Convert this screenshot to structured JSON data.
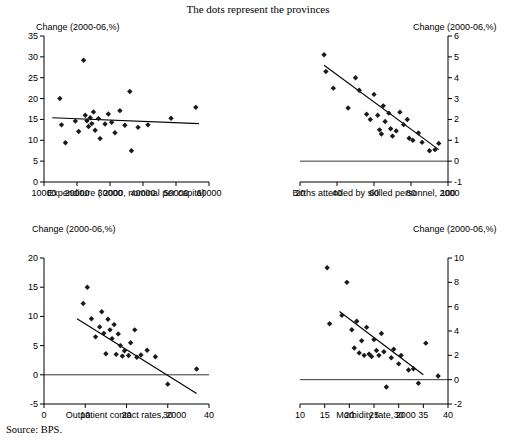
{
  "figure": {
    "title": "The dots represent the provinces",
    "source": "Source:  BPS."
  },
  "chart_data": [
    {
      "type": "scatter",
      "panel": "top-left",
      "title": "",
      "ylabel": "Change (2000-06,%)",
      "xlabel": "Expenditure ( 2000, nominal per capita)",
      "xlim": [
        10000,
        60000
      ],
      "ylim": [
        0,
        35
      ],
      "xticks": [
        10000,
        20000,
        30000,
        40000,
        50000,
        60000
      ],
      "yticks": [
        0,
        5,
        10,
        15,
        20,
        25,
        30,
        35
      ],
      "grid": false,
      "legend": "none",
      "trendline": {
        "x0": 12500,
        "y0": 15.4,
        "x1": 57000,
        "y1": 14.0
      },
      "points": [
        {
          "x": 14800,
          "y": 20.0
        },
        {
          "x": 15300,
          "y": 13.7
        },
        {
          "x": 16500,
          "y": 9.4
        },
        {
          "x": 19500,
          "y": 14.6
        },
        {
          "x": 20500,
          "y": 12.1
        },
        {
          "x": 22000,
          "y": 29.2
        },
        {
          "x": 22500,
          "y": 16.0
        },
        {
          "x": 23000,
          "y": 14.7
        },
        {
          "x": 23500,
          "y": 13.3
        },
        {
          "x": 24000,
          "y": 15.4
        },
        {
          "x": 24500,
          "y": 14.0
        },
        {
          "x": 25000,
          "y": 16.8
        },
        {
          "x": 25500,
          "y": 12.4
        },
        {
          "x": 26500,
          "y": 15.2
        },
        {
          "x": 27000,
          "y": 10.4
        },
        {
          "x": 28500,
          "y": 13.9
        },
        {
          "x": 29500,
          "y": 16.3
        },
        {
          "x": 30500,
          "y": 14.3
        },
        {
          "x": 31500,
          "y": 11.8
        },
        {
          "x": 33000,
          "y": 17.1
        },
        {
          "x": 34500,
          "y": 13.6
        },
        {
          "x": 36000,
          "y": 21.7
        },
        {
          "x": 36500,
          "y": 7.5
        },
        {
          "x": 38500,
          "y": 13.1
        },
        {
          "x": 41500,
          "y": 13.7
        },
        {
          "x": 48500,
          "y": 15.3
        },
        {
          "x": 56000,
          "y": 17.9
        }
      ]
    },
    {
      "type": "scatter",
      "panel": "top-right",
      "title": "",
      "ylabel": "Change (2000-06,%)",
      "xlabel": "Births attended by skilled personnel, 2000",
      "xlim": [
        20,
        100
      ],
      "ylim": [
        -1,
        6
      ],
      "xticks": [
        20,
        40,
        60,
        80,
        100
      ],
      "yticks": [
        -1,
        0,
        1,
        2,
        3,
        4,
        5,
        6
      ],
      "grid": false,
      "legend": "none",
      "zeroline": true,
      "trendline": {
        "x0": 33,
        "y0": 4.6,
        "x1": 95,
        "y1": 0.55
      },
      "points": [
        {
          "x": 33,
          "y": 5.1
        },
        {
          "x": 34,
          "y": 4.3
        },
        {
          "x": 38,
          "y": 3.5
        },
        {
          "x": 46,
          "y": 2.55
        },
        {
          "x": 50,
          "y": 4.0
        },
        {
          "x": 52,
          "y": 3.4
        },
        {
          "x": 56,
          "y": 2.25
        },
        {
          "x": 58,
          "y": 2.0
        },
        {
          "x": 60,
          "y": 3.2
        },
        {
          "x": 62,
          "y": 2.2
        },
        {
          "x": 63,
          "y": 1.5
        },
        {
          "x": 64,
          "y": 1.3
        },
        {
          "x": 65,
          "y": 2.65
        },
        {
          "x": 66,
          "y": 1.9
        },
        {
          "x": 68,
          "y": 2.3
        },
        {
          "x": 69,
          "y": 1.55
        },
        {
          "x": 70,
          "y": 1.2
        },
        {
          "x": 72,
          "y": 1.45
        },
        {
          "x": 74,
          "y": 2.35
        },
        {
          "x": 76,
          "y": 1.75
        },
        {
          "x": 78,
          "y": 2.0
        },
        {
          "x": 79,
          "y": 1.1
        },
        {
          "x": 81,
          "y": 1.0
        },
        {
          "x": 84,
          "y": 1.35
        },
        {
          "x": 86,
          "y": 0.9
        },
        {
          "x": 90,
          "y": 0.5
        },
        {
          "x": 93,
          "y": 0.55
        },
        {
          "x": 95,
          "y": 0.85
        }
      ]
    },
    {
      "type": "scatter",
      "panel": "bottom-left",
      "title": "",
      "ylabel": "Change (2000-06,%)",
      "xlabel": "Outpatient contact rates, 2000",
      "xlim": [
        0,
        40
      ],
      "ylim": [
        -5,
        20
      ],
      "xticks": [
        0,
        10,
        20,
        30,
        40
      ],
      "yticks": [
        -5,
        0,
        5,
        10,
        15,
        20
      ],
      "grid": false,
      "legend": "none",
      "zeroline": true,
      "trendline": {
        "x0": 8,
        "y0": 9.6,
        "x1": 37,
        "y1": -3.2
      },
      "points": [
        {
          "x": 9.5,
          "y": 12.2
        },
        {
          "x": 10.5,
          "y": 15.0
        },
        {
          "x": 11.5,
          "y": 9.6
        },
        {
          "x": 12.5,
          "y": 6.5
        },
        {
          "x": 13.5,
          "y": 8.2
        },
        {
          "x": 14.0,
          "y": 10.8
        },
        {
          "x": 14.5,
          "y": 7.1
        },
        {
          "x": 15.0,
          "y": 3.6
        },
        {
          "x": 15.5,
          "y": 9.5
        },
        {
          "x": 16.0,
          "y": 7.7
        },
        {
          "x": 16.5,
          "y": 6.2
        },
        {
          "x": 17.0,
          "y": 8.6
        },
        {
          "x": 17.5,
          "y": 3.5
        },
        {
          "x": 18.0,
          "y": 7.0
        },
        {
          "x": 18.5,
          "y": 5.0
        },
        {
          "x": 19.0,
          "y": 3.2
        },
        {
          "x": 19.5,
          "y": 4.1
        },
        {
          "x": 20.5,
          "y": 3.3
        },
        {
          "x": 21.0,
          "y": 5.5
        },
        {
          "x": 22.0,
          "y": 7.7
        },
        {
          "x": 22.5,
          "y": 3.0
        },
        {
          "x": 23.5,
          "y": 3.4
        },
        {
          "x": 25.0,
          "y": 4.2
        },
        {
          "x": 27.0,
          "y": 3.1
        },
        {
          "x": 30.0,
          "y": -1.6
        },
        {
          "x": 37.0,
          "y": 1.0
        }
      ]
    },
    {
      "type": "scatter",
      "panel": "bottom-right",
      "title": "",
      "ylabel": "Change (2000-06,%)",
      "xlabel": "Morbidity rate, 2000",
      "xlim": [
        10,
        40
      ],
      "ylim": [
        -2,
        10
      ],
      "xticks": [
        10,
        15,
        20,
        25,
        30,
        35,
        40
      ],
      "yticks": [
        -2,
        0,
        2,
        4,
        6,
        8,
        10
      ],
      "grid": false,
      "legend": "none",
      "zeroline": true,
      "trendline": {
        "x0": 18,
        "y0": 5.6,
        "x1": 35,
        "y1": 0.4
      },
      "points": [
        {
          "x": 15.5,
          "y": 9.2
        },
        {
          "x": 16.0,
          "y": 4.6
        },
        {
          "x": 18.5,
          "y": 5.3
        },
        {
          "x": 19.5,
          "y": 8.0
        },
        {
          "x": 20.5,
          "y": 4.1
        },
        {
          "x": 21.0,
          "y": 2.6
        },
        {
          "x": 21.5,
          "y": 4.8
        },
        {
          "x": 22.0,
          "y": 2.2
        },
        {
          "x": 22.5,
          "y": 3.2
        },
        {
          "x": 23.0,
          "y": 2.0
        },
        {
          "x": 23.5,
          "y": 4.3
        },
        {
          "x": 24.0,
          "y": 2.1
        },
        {
          "x": 24.5,
          "y": 1.9
        },
        {
          "x": 25.0,
          "y": 3.3
        },
        {
          "x": 25.5,
          "y": 2.4
        },
        {
          "x": 26.0,
          "y": 2.0
        },
        {
          "x": 26.5,
          "y": 3.8
        },
        {
          "x": 27.0,
          "y": 2.3
        },
        {
          "x": 27.5,
          "y": -0.6
        },
        {
          "x": 28.5,
          "y": 1.8
        },
        {
          "x": 29.0,
          "y": 2.5
        },
        {
          "x": 30.0,
          "y": 1.3
        },
        {
          "x": 30.5,
          "y": 2.0
        },
        {
          "x": 32.0,
          "y": 0.8
        },
        {
          "x": 33.0,
          "y": 0.9
        },
        {
          "x": 34.0,
          "y": -0.3
        },
        {
          "x": 35.5,
          "y": 3.0
        },
        {
          "x": 38.0,
          "y": 0.3
        }
      ]
    }
  ]
}
